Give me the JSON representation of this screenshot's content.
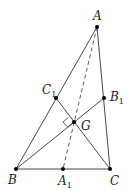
{
  "diagram": {
    "colors": {
      "line": "#333333",
      "point": "#000000",
      "background": "#ffffff"
    },
    "points": {
      "A": {
        "label": "A",
        "sub": "",
        "x": 97,
        "y": 27
      },
      "B": {
        "label": "B",
        "sub": "",
        "x": 16,
        "y": 169
      },
      "C": {
        "label": "C",
        "sub": "",
        "x": 110,
        "y": 169
      },
      "A1": {
        "label": "A",
        "sub": "1",
        "x": 63,
        "y": 169
      },
      "B1": {
        "label": "B",
        "sub": "1",
        "x": 104,
        "y": 98
      },
      "C1": {
        "label": "C",
        "sub": "1",
        "x": 56,
        "y": 98
      },
      "G": {
        "label": "G",
        "sub": "",
        "x": 74,
        "y": 122
      }
    },
    "segments": [
      {
        "from": "A",
        "to": "B",
        "style": "solid"
      },
      {
        "from": "A",
        "to": "C",
        "style": "solid"
      },
      {
        "from": "B",
        "to": "C",
        "style": "solid"
      },
      {
        "from": "B",
        "to": "B1",
        "style": "solid"
      },
      {
        "from": "C",
        "to": "C1",
        "style": "solid"
      },
      {
        "from": "A",
        "to": "A1",
        "style": "dashed"
      }
    ],
    "annotations": [
      "right-angle marker at G between BB1 and CC1"
    ]
  }
}
